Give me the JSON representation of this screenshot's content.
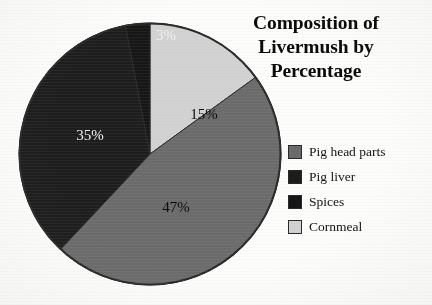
{
  "chart_data": {
    "type": "pie",
    "title": "Composition of Livermush by Percentage",
    "title_lines": [
      "Composition of",
      "Livermush by",
      "Percentage"
    ],
    "categories": [
      "Pig head parts",
      "Pig liver",
      "Spices",
      "Cornmeal"
    ],
    "values": [
      47,
      35,
      3,
      15
    ],
    "value_labels": [
      "47%",
      "35%",
      "3%",
      "15%"
    ],
    "colors": [
      "#6b6b6b",
      "#1d1d1d",
      "#161616",
      "#d2d2d2"
    ],
    "label_text_colors": [
      "#0c0c0c",
      "#f2f2f2",
      "#f2f2f2",
      "#0c0c0c"
    ],
    "start_angle_deg": 0,
    "direction": "clockwise",
    "slice_order_from_top_clockwise": [
      "Cornmeal",
      "Pig head parts",
      "Pig liver",
      "Spices"
    ],
    "xlabel": "",
    "ylabel": "",
    "grid": false,
    "legend_position": "right",
    "background_color": "#fdfdfb",
    "outline_color": "#2a2a2a"
  },
  "legend": {
    "items": [
      {
        "label": "Pig head parts",
        "color": "#6b6b6b"
      },
      {
        "label": "Pig liver",
        "color": "#1d1d1d"
      },
      {
        "label": "Spices",
        "color": "#161616"
      },
      {
        "label": "Cornmeal",
        "color": "#d2d2d2"
      }
    ]
  },
  "slice_labels": [
    {
      "text": "3%",
      "x": 148,
      "y": 18,
      "anchor": "middle",
      "tone": "light"
    },
    {
      "text": "15%",
      "x": 186,
      "y": 97,
      "anchor": "middle",
      "tone": "dark"
    },
    {
      "text": "47%",
      "x": 158,
      "y": 190,
      "anchor": "middle",
      "tone": "dark"
    },
    {
      "text": "35%",
      "x": 72,
      "y": 118,
      "anchor": "middle",
      "tone": "light"
    }
  ]
}
